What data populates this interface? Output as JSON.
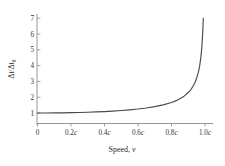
{
  "chart_data": {
    "type": "line",
    "title": "",
    "xlabel": "Speed, v",
    "ylabel": "Δt/Δt₀",
    "ylabel_parts": {
      "numerator": "Δt",
      "slash": "/",
      "denominator": "Δt",
      "subscript": "0"
    },
    "xlabel_parts": {
      "text": "Speed,",
      "variable": "v"
    },
    "xticks": [
      0,
      0.2,
      0.4,
      0.6,
      0.8,
      1.0
    ],
    "xtick_labels": [
      "0",
      "0.2c",
      "0.4c",
      "0.6c",
      "0.8c",
      "1.0c"
    ],
    "xtick_label_numbers": [
      "0",
      "0.2",
      "0.4",
      "0.6",
      "0.8",
      "1.0"
    ],
    "xtick_label_unit": "c",
    "yticks": [
      1,
      2,
      3,
      4,
      5,
      6,
      7
    ],
    "ytick_labels": [
      "1",
      "2",
      "3",
      "4",
      "5",
      "6",
      "7"
    ],
    "xlim": [
      0,
      1.0
    ],
    "ylim": [
      0.55,
      7.35
    ],
    "grid": false,
    "legend": null,
    "curve_color": "#4a4a4a",
    "axis_color": "#8a8a8a",
    "background_color": "#ffffff",
    "series": [
      {
        "name": "Δt/Δt₀ = 1/√(1 − v²/c²)",
        "x": [
          0.0,
          0.05,
          0.1,
          0.15,
          0.2,
          0.25,
          0.3,
          0.35,
          0.4,
          0.45,
          0.5,
          0.55,
          0.6,
          0.65,
          0.7,
          0.75,
          0.8,
          0.825,
          0.85,
          0.875,
          0.9,
          0.915,
          0.93,
          0.94,
          0.95,
          0.96,
          0.965,
          0.97,
          0.975,
          0.98,
          0.982,
          0.984,
          0.986,
          0.988,
          0.9898
        ],
        "values": [
          1.0,
          1.001,
          1.005,
          1.011,
          1.021,
          1.033,
          1.048,
          1.068,
          1.091,
          1.12,
          1.155,
          1.197,
          1.25,
          1.316,
          1.4,
          1.512,
          1.667,
          1.766,
          1.898,
          2.065,
          2.294,
          2.469,
          2.72,
          2.931,
          3.203,
          3.571,
          3.802,
          4.113,
          4.504,
          5.025,
          5.303,
          5.63,
          6.02,
          6.5,
          7.0
        ]
      }
    ]
  }
}
